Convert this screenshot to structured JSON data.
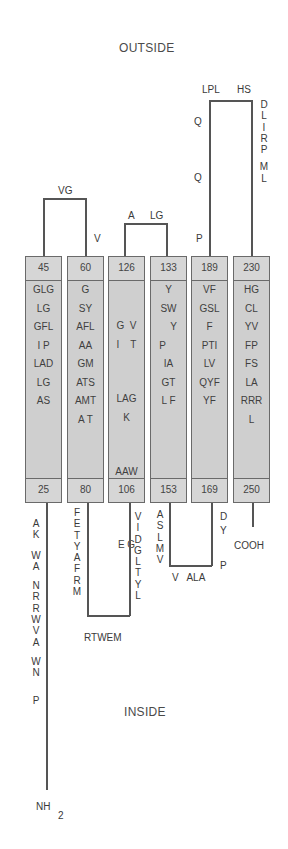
{
  "regions": {
    "outside": "OUTSIDE",
    "inside": "INSIDE"
  },
  "termini": {
    "n_terminus": "NH",
    "n_sub": "2",
    "c_terminus": "COOH"
  },
  "helices": [
    {
      "id": "TM1",
      "top": "45",
      "bottom": "25",
      "residues": [
        "GLG",
        "LG",
        "GFL",
        "I  P",
        "LAD",
        "LG",
        "AS",
        ""
      ]
    },
    {
      "id": "TM2",
      "top": "60",
      "bottom": "80",
      "residues": [
        "G",
        "SY",
        "AFL",
        "AA",
        "GM",
        "ATS",
        "AMT",
        "A  T"
      ]
    },
    {
      "id": "TM3",
      "top": "126",
      "bottom": "106",
      "residues": [
        "G  V",
        "I    T",
        "LAG",
        "K",
        "AAW",
        "W",
        "E G",
        ""
      ]
    },
    {
      "id": "TM4",
      "top": "133",
      "bottom": "153",
      "residues": [
        "Y",
        "SW",
        "Y",
        "P",
        "IA",
        "GT",
        "L F",
        ""
      ]
    },
    {
      "id": "TM5",
      "top": "189",
      "bottom": "169",
      "residues": [
        "VF",
        "GSL",
        "F",
        "PTI",
        "LV",
        "QYF",
        "YF",
        ""
      ]
    },
    {
      "id": "TM6",
      "top": "230",
      "bottom": "250",
      "residues": [
        "HG",
        "CL",
        "YV",
        "FP",
        "FS",
        "LA",
        "RRR",
        "L"
      ]
    }
  ],
  "loops": {
    "outside_1_2": {
      "top": "VG",
      "side": "V"
    },
    "outside_3_4": {
      "left": "A",
      "right": "LG"
    },
    "outside_5_6": {
      "top_left": "LPL",
      "top_right": "HS",
      "left_col": [
        "Q",
        "",
        "",
        "",
        "",
        "Q",
        "",
        "",
        "",
        "",
        "P"
      ],
      "right_col": [
        "D",
        "L",
        "I",
        "R",
        "P",
        "",
        "M",
        "L"
      ]
    },
    "n_tail": [
      "A",
      "K",
      "",
      "W",
      "A",
      "",
      "N",
      "R",
      "R",
      "W",
      "V",
      "A",
      "",
      "W",
      "N",
      "",
      "P"
    ],
    "inside_2_3": {
      "left_col": [
        "F",
        "E",
        "T",
        "Y",
        "A",
        "F",
        "R",
        "M"
      ],
      "bottom": "RTWEM",
      "right_col": [
        "V",
        "I",
        "D",
        "G",
        "L",
        "T",
        "Y",
        "L"
      ]
    },
    "inside_4_5": {
      "left_col": [
        "A",
        "S",
        "L",
        "M",
        "V"
      ],
      "bottom": "V   ALA",
      "right_col": [
        "D",
        "Y",
        "",
        "",
        "P"
      ]
    }
  }
}
